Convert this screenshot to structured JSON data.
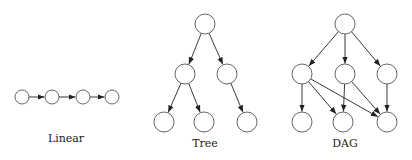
{
  "style": {
    "node_stroke": "#555555",
    "node_fill": "#ffffff",
    "edge_color": "#222222",
    "background": "#ffffff"
  },
  "diagrams": [
    {
      "id": "linear",
      "label": "Linear",
      "label_pos": [
        66,
        132
      ],
      "radius": 7,
      "nodes": [
        {
          "id": "l0",
          "x": 22,
          "y": 97
        },
        {
          "id": "l1",
          "x": 52,
          "y": 97
        },
        {
          "id": "l2",
          "x": 83,
          "y": 97
        },
        {
          "id": "l3",
          "x": 112,
          "y": 97
        }
      ],
      "edges": [
        [
          "l0",
          "l1"
        ],
        [
          "l1",
          "l2"
        ],
        [
          "l2",
          "l3"
        ]
      ]
    },
    {
      "id": "tree",
      "label": "Tree",
      "label_pos": [
        205,
        137
      ],
      "radius": 10,
      "nodes": [
        {
          "id": "t0",
          "x": 205,
          "y": 24
        },
        {
          "id": "t1",
          "x": 185,
          "y": 74
        },
        {
          "id": "t2",
          "x": 227,
          "y": 74
        },
        {
          "id": "t3",
          "x": 164,
          "y": 122
        },
        {
          "id": "t4",
          "x": 204,
          "y": 122
        },
        {
          "id": "t5",
          "x": 247,
          "y": 122
        }
      ],
      "edges": [
        [
          "t0",
          "t1"
        ],
        [
          "t0",
          "t2"
        ],
        [
          "t1",
          "t3"
        ],
        [
          "t1",
          "t4"
        ],
        [
          "t2",
          "t5"
        ]
      ]
    },
    {
      "id": "dag",
      "label": "DAG",
      "label_pos": [
        345,
        137
      ],
      "radius": 10,
      "nodes": [
        {
          "id": "d0",
          "x": 345,
          "y": 24
        },
        {
          "id": "d1",
          "x": 302,
          "y": 74
        },
        {
          "id": "d2",
          "x": 345,
          "y": 74
        },
        {
          "id": "d3",
          "x": 387,
          "y": 74
        },
        {
          "id": "d4",
          "x": 302,
          "y": 122
        },
        {
          "id": "d5",
          "x": 343,
          "y": 122
        },
        {
          "id": "d6",
          "x": 387,
          "y": 122
        }
      ],
      "edges": [
        [
          "d0",
          "d1"
        ],
        [
          "d0",
          "d2"
        ],
        [
          "d0",
          "d3"
        ],
        [
          "d1",
          "d4"
        ],
        [
          "d1",
          "d5"
        ],
        [
          "d1",
          "d6"
        ],
        [
          "d2",
          "d5"
        ],
        [
          "d2",
          "d6"
        ],
        [
          "d3",
          "d6"
        ]
      ]
    }
  ]
}
